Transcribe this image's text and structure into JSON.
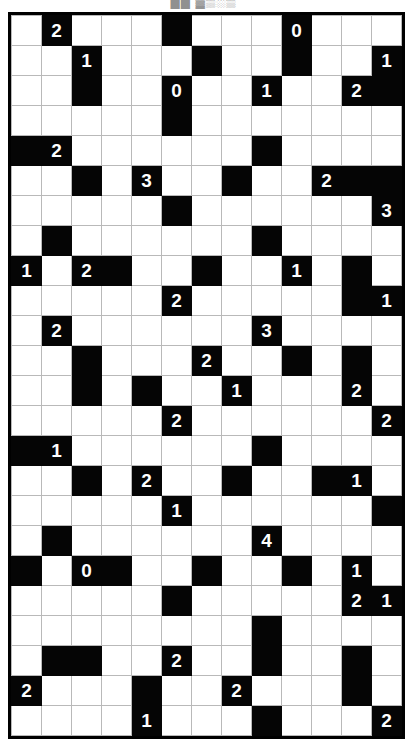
{
  "caption": {
    "text": "██ ▓▒░▒"
  },
  "puzzle": {
    "name": "nurikabe-grid",
    "type": "black-and-white-number-grid",
    "columns": 13,
    "rows": 23,
    "cell_size_px": 30,
    "colors": {
      "block_fill": "#050505",
      "block_text": "#ffffff",
      "empty_fill": "#ffffff",
      "grid_line": "#b9b9b9",
      "border": "#000000"
    },
    "legend": {
      "blank_cell": "",
      "black_cell": "filled",
      "clue_values": [
        "0",
        "1",
        "2",
        "3",
        "4"
      ]
    },
    "cells": [
      [
        {
          "b": 0,
          "v": ""
        },
        {
          "b": 1,
          "v": "2"
        },
        {
          "b": 0,
          "v": ""
        },
        {
          "b": 0,
          "v": ""
        },
        {
          "b": 0,
          "v": ""
        },
        {
          "b": 1,
          "v": ""
        },
        {
          "b": 0,
          "v": ""
        },
        {
          "b": 0,
          "v": ""
        },
        {
          "b": 0,
          "v": ""
        },
        {
          "b": 1,
          "v": "0"
        },
        {
          "b": 0,
          "v": ""
        },
        {
          "b": 0,
          "v": ""
        },
        {
          "b": 0,
          "v": ""
        }
      ],
      [
        {
          "b": 0,
          "v": ""
        },
        {
          "b": 0,
          "v": ""
        },
        {
          "b": 1,
          "v": "1"
        },
        {
          "b": 0,
          "v": ""
        },
        {
          "b": 0,
          "v": ""
        },
        {
          "b": 0,
          "v": ""
        },
        {
          "b": 1,
          "v": ""
        },
        {
          "b": 0,
          "v": ""
        },
        {
          "b": 0,
          "v": ""
        },
        {
          "b": 1,
          "v": ""
        },
        {
          "b": 0,
          "v": ""
        },
        {
          "b": 0,
          "v": ""
        },
        {
          "b": 1,
          "v": "1"
        }
      ],
      [
        {
          "b": 0,
          "v": ""
        },
        {
          "b": 0,
          "v": ""
        },
        {
          "b": 1,
          "v": ""
        },
        {
          "b": 0,
          "v": ""
        },
        {
          "b": 0,
          "v": ""
        },
        {
          "b": 1,
          "v": "0"
        },
        {
          "b": 0,
          "v": ""
        },
        {
          "b": 0,
          "v": ""
        },
        {
          "b": 1,
          "v": "1"
        },
        {
          "b": 0,
          "v": ""
        },
        {
          "b": 0,
          "v": ""
        },
        {
          "b": 1,
          "v": "2"
        },
        {
          "b": 1,
          "v": ""
        }
      ],
      [
        {
          "b": 0,
          "v": ""
        },
        {
          "b": 0,
          "v": ""
        },
        {
          "b": 0,
          "v": ""
        },
        {
          "b": 0,
          "v": ""
        },
        {
          "b": 0,
          "v": ""
        },
        {
          "b": 1,
          "v": ""
        },
        {
          "b": 0,
          "v": ""
        },
        {
          "b": 0,
          "v": ""
        },
        {
          "b": 0,
          "v": ""
        },
        {
          "b": 0,
          "v": ""
        },
        {
          "b": 0,
          "v": ""
        },
        {
          "b": 0,
          "v": ""
        },
        {
          "b": 0,
          "v": ""
        }
      ],
      [
        {
          "b": 1,
          "v": ""
        },
        {
          "b": 1,
          "v": "2"
        },
        {
          "b": 0,
          "v": ""
        },
        {
          "b": 0,
          "v": ""
        },
        {
          "b": 0,
          "v": ""
        },
        {
          "b": 0,
          "v": ""
        },
        {
          "b": 0,
          "v": ""
        },
        {
          "b": 0,
          "v": ""
        },
        {
          "b": 1,
          "v": ""
        },
        {
          "b": 0,
          "v": ""
        },
        {
          "b": 0,
          "v": ""
        },
        {
          "b": 0,
          "v": ""
        },
        {
          "b": 0,
          "v": ""
        }
      ],
      [
        {
          "b": 0,
          "v": ""
        },
        {
          "b": 0,
          "v": ""
        },
        {
          "b": 1,
          "v": ""
        },
        {
          "b": 0,
          "v": ""
        },
        {
          "b": 1,
          "v": "3"
        },
        {
          "b": 0,
          "v": ""
        },
        {
          "b": 0,
          "v": ""
        },
        {
          "b": 1,
          "v": ""
        },
        {
          "b": 0,
          "v": ""
        },
        {
          "b": 0,
          "v": ""
        },
        {
          "b": 1,
          "v": "2"
        },
        {
          "b": 1,
          "v": ""
        },
        {
          "b": 1,
          "v": ""
        }
      ],
      [
        {
          "b": 0,
          "v": ""
        },
        {
          "b": 0,
          "v": ""
        },
        {
          "b": 0,
          "v": ""
        },
        {
          "b": 0,
          "v": ""
        },
        {
          "b": 0,
          "v": ""
        },
        {
          "b": 1,
          "v": ""
        },
        {
          "b": 0,
          "v": ""
        },
        {
          "b": 0,
          "v": ""
        },
        {
          "b": 0,
          "v": ""
        },
        {
          "b": 0,
          "v": ""
        },
        {
          "b": 0,
          "v": ""
        },
        {
          "b": 0,
          "v": ""
        },
        {
          "b": 1,
          "v": "3"
        }
      ],
      [
        {
          "b": 0,
          "v": ""
        },
        {
          "b": 1,
          "v": ""
        },
        {
          "b": 0,
          "v": ""
        },
        {
          "b": 0,
          "v": ""
        },
        {
          "b": 0,
          "v": ""
        },
        {
          "b": 0,
          "v": ""
        },
        {
          "b": 0,
          "v": ""
        },
        {
          "b": 0,
          "v": ""
        },
        {
          "b": 1,
          "v": ""
        },
        {
          "b": 0,
          "v": ""
        },
        {
          "b": 0,
          "v": ""
        },
        {
          "b": 0,
          "v": ""
        },
        {
          "b": 0,
          "v": ""
        }
      ],
      [
        {
          "b": 1,
          "v": "1"
        },
        {
          "b": 0,
          "v": ""
        },
        {
          "b": 1,
          "v": "2"
        },
        {
          "b": 1,
          "v": ""
        },
        {
          "b": 0,
          "v": ""
        },
        {
          "b": 0,
          "v": ""
        },
        {
          "b": 1,
          "v": ""
        },
        {
          "b": 0,
          "v": ""
        },
        {
          "b": 0,
          "v": ""
        },
        {
          "b": 1,
          "v": "1"
        },
        {
          "b": 0,
          "v": ""
        },
        {
          "b": 1,
          "v": ""
        },
        {
          "b": 0,
          "v": ""
        }
      ],
      [
        {
          "b": 0,
          "v": ""
        },
        {
          "b": 0,
          "v": ""
        },
        {
          "b": 0,
          "v": ""
        },
        {
          "b": 0,
          "v": ""
        },
        {
          "b": 0,
          "v": ""
        },
        {
          "b": 1,
          "v": "2"
        },
        {
          "b": 0,
          "v": ""
        },
        {
          "b": 0,
          "v": ""
        },
        {
          "b": 0,
          "v": ""
        },
        {
          "b": 0,
          "v": ""
        },
        {
          "b": 0,
          "v": ""
        },
        {
          "b": 1,
          "v": ""
        },
        {
          "b": 1,
          "v": "1"
        }
      ],
      [
        {
          "b": 0,
          "v": ""
        },
        {
          "b": 1,
          "v": "2"
        },
        {
          "b": 0,
          "v": ""
        },
        {
          "b": 0,
          "v": ""
        },
        {
          "b": 0,
          "v": ""
        },
        {
          "b": 0,
          "v": ""
        },
        {
          "b": 0,
          "v": ""
        },
        {
          "b": 0,
          "v": ""
        },
        {
          "b": 1,
          "v": "3"
        },
        {
          "b": 0,
          "v": ""
        },
        {
          "b": 0,
          "v": ""
        },
        {
          "b": 0,
          "v": ""
        },
        {
          "b": 0,
          "v": ""
        }
      ],
      [
        {
          "b": 0,
          "v": ""
        },
        {
          "b": 0,
          "v": ""
        },
        {
          "b": 1,
          "v": ""
        },
        {
          "b": 0,
          "v": ""
        },
        {
          "b": 0,
          "v": ""
        },
        {
          "b": 0,
          "v": ""
        },
        {
          "b": 1,
          "v": "2"
        },
        {
          "b": 0,
          "v": ""
        },
        {
          "b": 0,
          "v": ""
        },
        {
          "b": 1,
          "v": ""
        },
        {
          "b": 0,
          "v": ""
        },
        {
          "b": 1,
          "v": ""
        },
        {
          "b": 0,
          "v": ""
        }
      ],
      [
        {
          "b": 0,
          "v": ""
        },
        {
          "b": 0,
          "v": ""
        },
        {
          "b": 1,
          "v": ""
        },
        {
          "b": 0,
          "v": ""
        },
        {
          "b": 1,
          "v": ""
        },
        {
          "b": 0,
          "v": ""
        },
        {
          "b": 0,
          "v": ""
        },
        {
          "b": 1,
          "v": "1"
        },
        {
          "b": 0,
          "v": ""
        },
        {
          "b": 0,
          "v": ""
        },
        {
          "b": 0,
          "v": ""
        },
        {
          "b": 1,
          "v": "2"
        },
        {
          "b": 0,
          "v": ""
        }
      ],
      [
        {
          "b": 0,
          "v": ""
        },
        {
          "b": 0,
          "v": ""
        },
        {
          "b": 0,
          "v": ""
        },
        {
          "b": 0,
          "v": ""
        },
        {
          "b": 0,
          "v": ""
        },
        {
          "b": 1,
          "v": "2"
        },
        {
          "b": 0,
          "v": ""
        },
        {
          "b": 0,
          "v": ""
        },
        {
          "b": 0,
          "v": ""
        },
        {
          "b": 0,
          "v": ""
        },
        {
          "b": 0,
          "v": ""
        },
        {
          "b": 0,
          "v": ""
        },
        {
          "b": 1,
          "v": "2"
        }
      ],
      [
        {
          "b": 1,
          "v": ""
        },
        {
          "b": 1,
          "v": "1"
        },
        {
          "b": 0,
          "v": ""
        },
        {
          "b": 0,
          "v": ""
        },
        {
          "b": 0,
          "v": ""
        },
        {
          "b": 0,
          "v": ""
        },
        {
          "b": 0,
          "v": ""
        },
        {
          "b": 0,
          "v": ""
        },
        {
          "b": 1,
          "v": ""
        },
        {
          "b": 0,
          "v": ""
        },
        {
          "b": 0,
          "v": ""
        },
        {
          "b": 0,
          "v": ""
        },
        {
          "b": 0,
          "v": ""
        }
      ],
      [
        {
          "b": 0,
          "v": ""
        },
        {
          "b": 0,
          "v": ""
        },
        {
          "b": 1,
          "v": ""
        },
        {
          "b": 0,
          "v": ""
        },
        {
          "b": 1,
          "v": "2"
        },
        {
          "b": 0,
          "v": ""
        },
        {
          "b": 0,
          "v": ""
        },
        {
          "b": 1,
          "v": ""
        },
        {
          "b": 0,
          "v": ""
        },
        {
          "b": 0,
          "v": ""
        },
        {
          "b": 1,
          "v": ""
        },
        {
          "b": 1,
          "v": "1"
        },
        {
          "b": 0,
          "v": ""
        },
        {
          "b": 1,
          "v": "2"
        }
      ],
      [
        {
          "b": 0,
          "v": ""
        },
        {
          "b": 0,
          "v": ""
        },
        {
          "b": 0,
          "v": ""
        },
        {
          "b": 0,
          "v": ""
        },
        {
          "b": 0,
          "v": ""
        },
        {
          "b": 1,
          "v": "1"
        },
        {
          "b": 0,
          "v": ""
        },
        {
          "b": 0,
          "v": ""
        },
        {
          "b": 0,
          "v": ""
        },
        {
          "b": 0,
          "v": ""
        },
        {
          "b": 0,
          "v": ""
        },
        {
          "b": 0,
          "v": ""
        },
        {
          "b": 1,
          "v": ""
        }
      ],
      [
        {
          "b": 0,
          "v": ""
        },
        {
          "b": 1,
          "v": ""
        },
        {
          "b": 0,
          "v": ""
        },
        {
          "b": 0,
          "v": ""
        },
        {
          "b": 0,
          "v": ""
        },
        {
          "b": 0,
          "v": ""
        },
        {
          "b": 0,
          "v": ""
        },
        {
          "b": 0,
          "v": ""
        },
        {
          "b": 1,
          "v": "4"
        },
        {
          "b": 0,
          "v": ""
        },
        {
          "b": 0,
          "v": ""
        },
        {
          "b": 0,
          "v": ""
        },
        {
          "b": 0,
          "v": ""
        }
      ],
      [
        {
          "b": 1,
          "v": ""
        },
        {
          "b": 0,
          "v": ""
        },
        {
          "b": 1,
          "v": "0"
        },
        {
          "b": 1,
          "v": ""
        },
        {
          "b": 0,
          "v": ""
        },
        {
          "b": 0,
          "v": ""
        },
        {
          "b": 1,
          "v": ""
        },
        {
          "b": 0,
          "v": ""
        },
        {
          "b": 0,
          "v": ""
        },
        {
          "b": 1,
          "v": ""
        },
        {
          "b": 0,
          "v": ""
        },
        {
          "b": 1,
          "v": "1"
        },
        {
          "b": 0,
          "v": ""
        }
      ],
      [
        {
          "b": 0,
          "v": ""
        },
        {
          "b": 0,
          "v": ""
        },
        {
          "b": 0,
          "v": ""
        },
        {
          "b": 0,
          "v": ""
        },
        {
          "b": 0,
          "v": ""
        },
        {
          "b": 1,
          "v": ""
        },
        {
          "b": 0,
          "v": ""
        },
        {
          "b": 0,
          "v": ""
        },
        {
          "b": 0,
          "v": ""
        },
        {
          "b": 0,
          "v": ""
        },
        {
          "b": 0,
          "v": ""
        },
        {
          "b": 1,
          "v": "2"
        },
        {
          "b": 1,
          "v": "1"
        }
      ],
      [
        {
          "b": 0,
          "v": ""
        },
        {
          "b": 0,
          "v": ""
        },
        {
          "b": 0,
          "v": ""
        },
        {
          "b": 0,
          "v": ""
        },
        {
          "b": 0,
          "v": ""
        },
        {
          "b": 0,
          "v": ""
        },
        {
          "b": 0,
          "v": ""
        },
        {
          "b": 0,
          "v": ""
        },
        {
          "b": 1,
          "v": ""
        },
        {
          "b": 0,
          "v": ""
        },
        {
          "b": 0,
          "v": ""
        },
        {
          "b": 0,
          "v": ""
        },
        {
          "b": 0,
          "v": ""
        }
      ],
      [
        {
          "b": 0,
          "v": ""
        },
        {
          "b": 1,
          "v": ""
        },
        {
          "b": 1,
          "v": ""
        },
        {
          "b": 0,
          "v": ""
        },
        {
          "b": 0,
          "v": ""
        },
        {
          "b": 1,
          "v": "2"
        },
        {
          "b": 0,
          "v": ""
        },
        {
          "b": 0,
          "v": ""
        },
        {
          "b": 1,
          "v": ""
        },
        {
          "b": 0,
          "v": ""
        },
        {
          "b": 0,
          "v": ""
        },
        {
          "b": 1,
          "v": ""
        },
        {
          "b": 0,
          "v": ""
        }
      ],
      [
        {
          "b": 1,
          "v": "2"
        },
        {
          "b": 0,
          "v": ""
        },
        {
          "b": 0,
          "v": ""
        },
        {
          "b": 0,
          "v": ""
        },
        {
          "b": 1,
          "v": ""
        },
        {
          "b": 0,
          "v": ""
        },
        {
          "b": 0,
          "v": ""
        },
        {
          "b": 1,
          "v": "2"
        },
        {
          "b": 0,
          "v": ""
        },
        {
          "b": 0,
          "v": ""
        },
        {
          "b": 0,
          "v": ""
        },
        {
          "b": 1,
          "v": ""
        },
        {
          "b": 0,
          "v": ""
        }
      ],
      [
        {
          "b": 0,
          "v": ""
        },
        {
          "b": 0,
          "v": ""
        },
        {
          "b": 0,
          "v": ""
        },
        {
          "b": 0,
          "v": ""
        },
        {
          "b": 1,
          "v": "1"
        },
        {
          "b": 0,
          "v": ""
        },
        {
          "b": 0,
          "v": ""
        },
        {
          "b": 0,
          "v": ""
        },
        {
          "b": 1,
          "v": ""
        },
        {
          "b": 0,
          "v": ""
        },
        {
          "b": 0,
          "v": ""
        },
        {
          "b": 0,
          "v": ""
        },
        {
          "b": 1,
          "v": "2"
        }
      ]
    ]
  }
}
